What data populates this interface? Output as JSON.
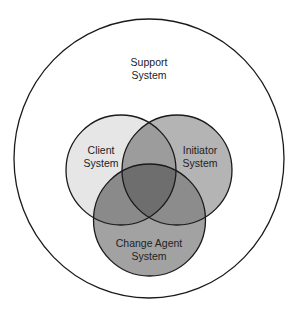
{
  "diagram": {
    "type": "venn",
    "outer": {
      "label_line1": "Support",
      "label_line2": "System",
      "fill": "#ffffff",
      "stroke": "#1a1a1a"
    },
    "sets": [
      {
        "id": "client",
        "label_line1": "Client",
        "label_line2": "System",
        "fill": "#e6e6e6"
      },
      {
        "id": "initiator",
        "label_line1": "Initiator",
        "label_line2": "System",
        "fill": "#b4b4b4"
      },
      {
        "id": "change_agent",
        "label_line1": "Change Agent",
        "label_line2": "System",
        "fill": "#a2a2a2"
      }
    ],
    "overlaps": {
      "client_initiator": "#9c9c9c",
      "client_change_agent": "#8a8a8a",
      "initiator_change_agent": "#8c8c8c",
      "all_three": "#6e6e6e"
    }
  }
}
